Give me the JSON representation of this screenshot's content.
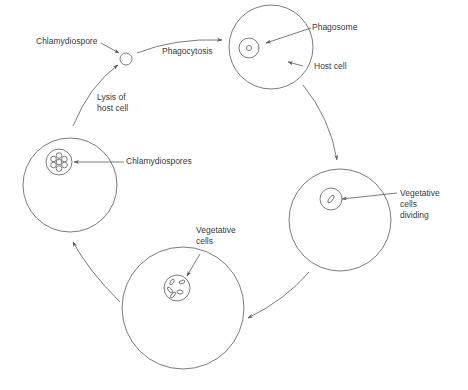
{
  "colors": {
    "stroke": "#5a5a5a",
    "text": "#3a3a3a",
    "background": "#ffffff"
  },
  "labels": {
    "chlamydiospore": "Chlamydiospore",
    "phagocytosis": "Phagocytosis",
    "phagosome": "Phagosome",
    "host_cell": "Host cell",
    "lysis_line1": "Lysis of",
    "lysis_line2": "host cell",
    "chlamydiospores": "Chlamydiospores",
    "vegetative_dividing_line1": "Vegetative",
    "vegetative_dividing_line2": "cells",
    "vegetative_dividing_line3": "dividing",
    "vegetative_line1": "Vegetative",
    "vegetative_line2": "cells"
  },
  "stages": [
    {
      "name": "free-chlamydiospore",
      "label": "Chlamydiospore"
    },
    {
      "name": "phagosome-in-host-cell",
      "label": "Phagosome / Host cell"
    },
    {
      "name": "vegetative-cells-dividing",
      "label": "Vegetative cells dividing"
    },
    {
      "name": "vegetative-cells",
      "label": "Vegetative cells"
    },
    {
      "name": "chlamydiospores-in-host",
      "label": "Chlamydiospores"
    }
  ],
  "transitions": [
    {
      "from": "free-chlamydiospore",
      "to": "phagosome-in-host-cell",
      "label": "Phagocytosis"
    },
    {
      "from": "phagosome-in-host-cell",
      "to": "vegetative-cells-dividing",
      "label": ""
    },
    {
      "from": "vegetative-cells-dividing",
      "to": "vegetative-cells",
      "label": ""
    },
    {
      "from": "vegetative-cells",
      "to": "chlamydiospores-in-host",
      "label": ""
    },
    {
      "from": "chlamydiospores-in-host",
      "to": "free-chlamydiospore",
      "label": "Lysis of host cell"
    }
  ]
}
